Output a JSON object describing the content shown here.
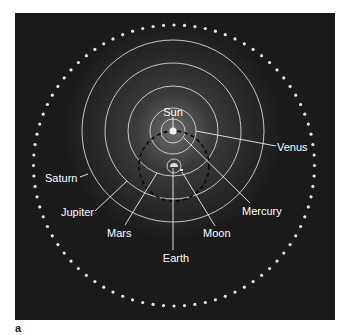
{
  "figure": {
    "panel_letter": "a",
    "background": "#1a1a1a",
    "labels": {
      "sun": "Sun",
      "venus": "Venus",
      "mercury": "Mercury",
      "moon": "Moon",
      "earth": "Earth",
      "mars": "Mars",
      "jupiter": "Jupiter",
      "saturn": "Saturn"
    },
    "colors": {
      "orbit": "#d8d8d8",
      "star_dots": "#e6e6e6",
      "dashed_orbit": "#0a0a0a",
      "label": "#ffffff"
    }
  }
}
